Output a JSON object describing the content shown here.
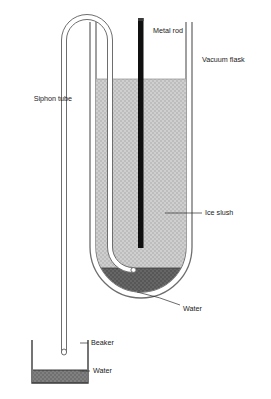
{
  "diagram": {
    "background_color": "#ffffff",
    "width": 271,
    "height": 399
  },
  "labels": {
    "metal_rod": "Metal rod",
    "vacuum_flask": "Vacuum flask",
    "siphon_tube": "Siphon tube",
    "ice_slush": "Ice slush",
    "water_flask": "Water",
    "beaker": "Beaker",
    "water_beaker": "Water"
  },
  "components": {
    "metal_rod": {
      "name": "Metal rod",
      "color": "#101010",
      "description": "Vertical black rod inserted from above through the ice slush"
    },
    "vacuum_flask": {
      "name": "Vacuum flask",
      "wall_color": "#6e6e6e",
      "description": "Double-walled insulated flask with rounded bottom"
    },
    "siphon_tube": {
      "name": "Siphon tube",
      "wall_color": "#6e6e6e",
      "description": "Inverted U tube running over the flask rim into the water layer and down to the beaker"
    },
    "ice_slush": {
      "name": "Ice slush",
      "fill_color": "#c6c6c6",
      "description": "Light grey stippled region filling most of the flask"
    },
    "water_flask": {
      "name": "Water",
      "fill_color": "#616161",
      "description": "Dark grey meltwater layer at the bottom of the flask"
    },
    "beaker": {
      "name": "Beaker",
      "wall_color": "#3a3a3a",
      "description": "Open rectangular vessel collecting the siphoned water"
    },
    "water_beaker": {
      "name": "Water",
      "fill_color": "#7a7a7a",
      "description": "Collected water at the bottom of the beaker"
    }
  },
  "colors": {
    "outline": "#6e6e6e",
    "outline_dark": "#3a3a3a",
    "rod": "#101010",
    "slush": "#c6c6c6",
    "water_dark": "#616161",
    "water_mid": "#7a7a7a",
    "text": "#1a1a1a",
    "background": "#ffffff"
  }
}
